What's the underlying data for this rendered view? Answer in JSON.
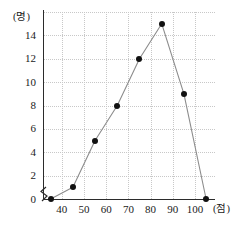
{
  "chart_data": {
    "type": "line",
    "title": "",
    "subtitle": "",
    "xlabel": "(점)",
    "ylabel": "(명)",
    "x": [
      35,
      45,
      55,
      65,
      75,
      85,
      95,
      105
    ],
    "values": [
      0,
      1,
      5,
      8,
      12,
      15,
      9,
      0
    ],
    "series": [
      {
        "name": "도수",
        "values": [
          0,
          1,
          5,
          8,
          12,
          15,
          9,
          0
        ]
      }
    ],
    "xticks": [
      40,
      50,
      60,
      70,
      80,
      90,
      100
    ],
    "xtick_labels": [
      "40",
      "50",
      "60",
      "70",
      "80",
      "90",
      "100"
    ],
    "yticks": [
      0,
      2,
      4,
      6,
      8,
      10,
      12,
      14
    ],
    "ytick_labels": [
      "0",
      "2",
      "4",
      "6",
      "8",
      "10",
      "12",
      "14"
    ],
    "xlim": [
      32,
      109
    ],
    "ylim": [
      0,
      16
    ],
    "grid": true,
    "grid_style": "dotted",
    "legend": "none",
    "marker": "filled-circle",
    "axis_break": "y-origin-zigzag",
    "colors": {
      "line": "#8c8c8c",
      "marker": "#111111",
      "grid": "#c8c8c8",
      "axis": "#2b2b2b",
      "text": "#1a1a1a",
      "background": "#ffffff"
    }
  },
  "axis_labels": {
    "y_unit": "(명)",
    "x_unit": "(점)"
  }
}
